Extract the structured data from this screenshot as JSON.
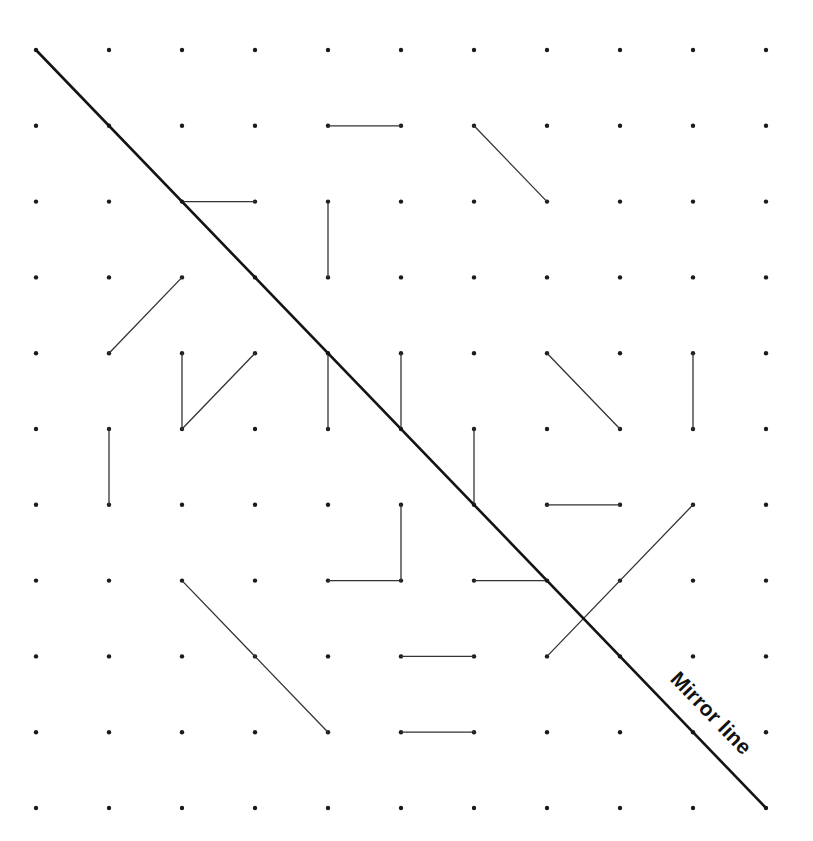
{
  "diagram": {
    "title": "",
    "grid": {
      "cols": 11,
      "rows": 11,
      "origin_x": 36,
      "origin_y": 50,
      "step_x": 73,
      "step_y": 75.8,
      "dot_color": "#1a1a1a"
    },
    "mirror_line": {
      "label": "Mirror line",
      "from": [
        0,
        0
      ],
      "to": [
        10,
        10
      ],
      "color": "#141414",
      "label_position": [
        706,
        718
      ],
      "label_angle_deg": 46
    },
    "segments": [
      {
        "from": [
          4,
          1
        ],
        "to": [
          5,
          1
        ]
      },
      {
        "from": [
          6,
          1
        ],
        "to": [
          7,
          2
        ]
      },
      {
        "from": [
          2,
          2
        ],
        "to": [
          3,
          2
        ]
      },
      {
        "from": [
          4,
          2
        ],
        "to": [
          4,
          3
        ]
      },
      {
        "from": [
          2,
          3
        ],
        "to": [
          1,
          4
        ]
      },
      {
        "from": [
          2,
          4
        ],
        "to": [
          2,
          5
        ]
      },
      {
        "from": [
          2,
          5
        ],
        "to": [
          3,
          4
        ]
      },
      {
        "from": [
          4,
          4
        ],
        "to": [
          4,
          5
        ]
      },
      {
        "from": [
          5,
          4
        ],
        "to": [
          5,
          5
        ]
      },
      {
        "from": [
          7,
          4
        ],
        "to": [
          8,
          5
        ]
      },
      {
        "from": [
          9,
          4
        ],
        "to": [
          9,
          5
        ]
      },
      {
        "from": [
          1,
          5
        ],
        "to": [
          1,
          6
        ]
      },
      {
        "from": [
          6,
          5
        ],
        "to": [
          6,
          6
        ]
      },
      {
        "from": [
          7,
          6
        ],
        "to": [
          8,
          6
        ]
      },
      {
        "from": [
          5,
          6
        ],
        "to": [
          5,
          7
        ]
      },
      {
        "from": [
          4,
          7
        ],
        "to": [
          5,
          7
        ]
      },
      {
        "from": [
          6,
          7
        ],
        "to": [
          7,
          7
        ]
      },
      {
        "from": [
          9,
          6
        ],
        "to": [
          7,
          8
        ]
      },
      {
        "from": [
          2,
          7
        ],
        "to": [
          4,
          9
        ]
      },
      {
        "from": [
          5,
          8
        ],
        "to": [
          6,
          8
        ]
      },
      {
        "from": [
          5,
          9
        ],
        "to": [
          6,
          9
        ]
      }
    ],
    "segment_color": "#333333"
  }
}
